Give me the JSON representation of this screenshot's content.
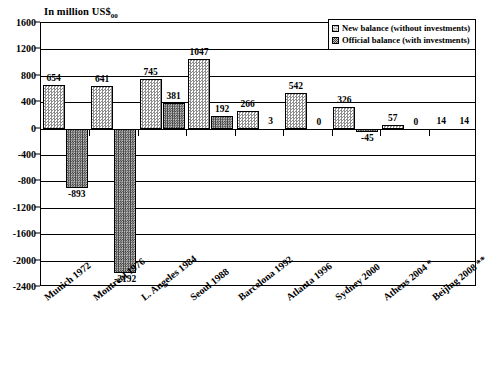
{
  "chart_data": {
    "type": "bar",
    "title": "In million US$",
    "title_sub": "00",
    "xlabel": "",
    "ylabel": "In million US$00",
    "ylim": [
      -2400,
      1600
    ],
    "yticks": [
      1600,
      1200,
      800,
      400,
      0,
      -400,
      -800,
      -1200,
      -1600,
      -2000,
      -2400
    ],
    "ytick_labels": [
      "1600",
      "1200",
      "800",
      "400",
      "0",
      "-400",
      "-800",
      "-1200",
      "-1600",
      "-2000",
      "-2400"
    ],
    "grid": true,
    "legend_position": "top-right",
    "categories": [
      "Munich 1972",
      "Montreal 1976",
      "L. Angeles 1984",
      "Seoul 1988",
      "Barcelona 1992",
      "Atlanta 1996",
      "Sydney 2000",
      "Athens 2004 *",
      "Beijing 2008 **"
    ],
    "series": [
      {
        "name": "New balance (without investments)",
        "values": [
          654,
          641,
          745,
          1047,
          266,
          542,
          326,
          57,
          14
        ],
        "labels": [
          "654",
          "641",
          "745",
          "1047",
          "266",
          "542",
          "326",
          "57",
          "14"
        ]
      },
      {
        "name": "Official balance (with investments)",
        "values": [
          -893,
          -2192,
          381,
          192,
          3,
          0,
          -45,
          0,
          14
        ],
        "labels": [
          "-893",
          "-2192",
          "381",
          "192",
          "3",
          "0",
          "-45",
          "0",
          "14"
        ]
      }
    ]
  },
  "legend": {
    "items": [
      {
        "label": "New balance (without investments)",
        "swatch": "light"
      },
      {
        "label": "Official balance (with investments)",
        "swatch": "dark"
      }
    ]
  }
}
